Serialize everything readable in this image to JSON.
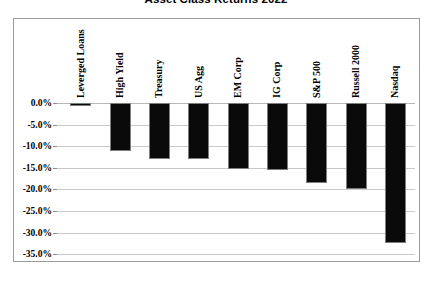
{
  "chart_data": {
    "type": "bar",
    "title": "Asset Class Returns 2022",
    "xlabel": "",
    "ylabel": "",
    "categories": [
      "Leverged Loans",
      "High Yield",
      "Treasury",
      "US Agg",
      "EM Corp",
      "IG Corp",
      "S&P 500",
      "Russell 2000",
      "Nasdaq"
    ],
    "values": [
      -0.6,
      -11.0,
      -12.9,
      -13.0,
      -15.3,
      -15.4,
      -18.5,
      -20.0,
      -32.5
    ],
    "value_labels": [
      "-0.6%",
      "-11.0%",
      "-12.9%",
      "-13.0%",
      "-15.3%",
      "-15.4%",
      "-18.5%",
      "-20.0%",
      "-32.5%"
    ],
    "ylim": [
      -35,
      0
    ],
    "yticks": [
      0,
      -5,
      -10,
      -15,
      -20,
      -25,
      -30,
      -35
    ],
    "ytick_labels": [
      "0.0%",
      "-5.0%",
      "-10.0%",
      "-15.0%",
      "-20.0%",
      "-25.0%",
      "-30.0%",
      "-35.0%"
    ],
    "grid": true,
    "legend": false,
    "bar_color": "#0a0a0a",
    "bar_border_color": "#7d7d7d",
    "gridline_color": "#c9c9c9",
    "plot_border_color": "#9a9a9a",
    "background_color": "#ffffff"
  }
}
